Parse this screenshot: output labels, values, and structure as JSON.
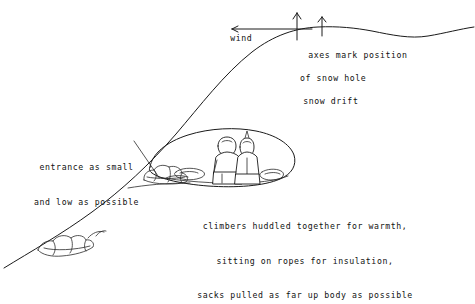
{
  "diagram": {
    "background_color": "#ffffff",
    "ink_color": "#1a1a1a",
    "title_hidden": "",
    "labels": {
      "wind": "wind",
      "axes_line1": "axes mark position",
      "axes_line2": "of snow hole",
      "snow_drift": "snow drift",
      "entrance_line1": "entrance as small",
      "entrance_line2": "and low as possible",
      "climbers_line1": "climbers huddled together for warmth,",
      "climbers_line2": "sitting on ropes for insulation,",
      "climbers_line3": "sacks pulled as far up body as possible"
    },
    "icons": {
      "wind_arrow": "arrow-left-icon",
      "ice_axe_left": "ice-axe-icon",
      "ice_axe_right": "ice-axe-icon",
      "snow_cave": "snow-cave-icon",
      "climber_left": "climber-figure-icon",
      "climber_right": "climber-figure-icon",
      "entrance_blocks": "snow-block-pile-icon",
      "rock_outcrop": "rock-outcrop-icon",
      "leader_line": "leader-line-icon",
      "slope_ridge": "snow-slope-ridge-icon"
    }
  }
}
